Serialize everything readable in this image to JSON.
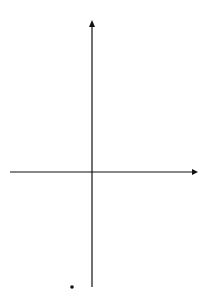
{
  "chart_data": {
    "type": "line",
    "title": "",
    "xlabel": "x",
    "ylabel": "y",
    "xlim": [
      -4.3,
      5.3
    ],
    "ylim": [
      -6.05,
      7.7
    ],
    "grid": true,
    "grid_step": 0.4,
    "x_ticks": [
      -4,
      -2,
      2,
      4
    ],
    "x_tick_labels": [
      "-4",
      "-2",
      "2",
      "4"
    ],
    "y_ticks": [
      -6,
      -4,
      -2,
      2,
      4,
      6
    ],
    "y_tick_labels": [
      "-6",
      "-4",
      "-2",
      "2",
      "4",
      "6"
    ],
    "origin_label": "0",
    "series": [
      {
        "name": "cubic curve",
        "x": [
          -1.05,
          -0.8,
          -0.6,
          -0.4,
          -0.2,
          -0.1,
          0.1,
          0.3,
          0.5,
          0.7,
          0.9,
          1.0,
          1.1,
          1.3,
          1.5,
          1.7,
          1.85
        ],
        "y": [
          -6.05,
          -3.2,
          -1.3,
          -0.1,
          0.45,
          0.5,
          0.2,
          -0.6,
          -1.6,
          -2.5,
          -2.95,
          -3.0,
          -2.9,
          -2.0,
          -0.3,
          3.0,
          6.9
        ]
      }
    ],
    "annotations": [
      {
        "label": "A",
        "x": -0.1,
        "y": 0.5,
        "description": "local maximum"
      },
      {
        "label": "B",
        "x": 1.0,
        "y": -3.0,
        "description": "local minimum"
      }
    ]
  },
  "labels": {
    "x_axis": "x",
    "y_axis": "y",
    "origin": "0",
    "point_a": "A",
    "point_b": "B",
    "xt": [
      "-4",
      "-2",
      "2",
      "4"
    ],
    "yt": [
      "6",
      "4",
      "2",
      "-2",
      "-4",
      "-6"
    ]
  }
}
